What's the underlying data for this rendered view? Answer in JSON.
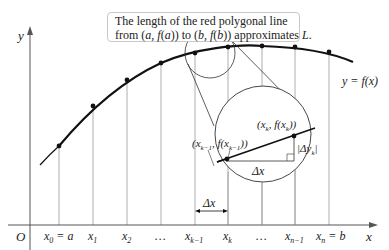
{
  "callout": {
    "line1": "The length of the red polygonal line",
    "line2_prefix": "from (",
    "line2_a": "a",
    "line2_mid1": ", ",
    "line2_fa": "f",
    "line2_mid2": "(",
    "line2_a2": "a",
    "line2_mid3": ")) to (",
    "line2_b": "b",
    "line2_mid4": ", ",
    "line2_fb": "f",
    "line2_mid5": "(",
    "line2_b2": "b",
    "line2_mid6": ")) approximates ",
    "line2_L": "L",
    "line2_end": "."
  },
  "axes": {
    "y_label": "y",
    "x_label": "x",
    "origin_label": "O"
  },
  "curve_label": "y = f(x)",
  "ticks": [
    {
      "base": "x",
      "sub": "0",
      "suffix": " = a"
    },
    {
      "base": "x",
      "sub": "1",
      "suffix": ""
    },
    {
      "base": "x",
      "sub": "2",
      "suffix": ""
    },
    {
      "base": "…",
      "sub": "",
      "suffix": ""
    },
    {
      "base": "x",
      "sub": "k−1",
      "suffix": ""
    },
    {
      "base": "x",
      "sub": "k",
      "suffix": ""
    },
    {
      "base": "…",
      "sub": "",
      "suffix": ""
    },
    {
      "base": "x",
      "sub": "n−1",
      "suffix": ""
    },
    {
      "base": "x",
      "sub": "n",
      "suffix": " = b"
    }
  ],
  "magnifier": {
    "point_prev": {
      "open": "(x",
      "sub1": "k−1",
      "mid": ", f(x",
      "sub2": "k−1",
      "close": "))"
    },
    "point_curr": {
      "open": "(x",
      "sub1": "k",
      "mid": ", f(x",
      "sub2": "k",
      "close": "))"
    },
    "dx_label": "Δx",
    "dy_label_prefix": "|Δy",
    "dy_label_sub": "k",
    "dy_label_suffix": "|"
  },
  "interval_label": "Δx",
  "colors": {
    "curve": "#111111",
    "grid": "#9a9a9a",
    "axis": "#555555"
  }
}
